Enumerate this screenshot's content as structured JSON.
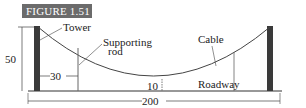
{
  "figure": {
    "label": "FIGURE 1.51"
  },
  "labels": {
    "tower": "Tower",
    "supporting_rod": "Supporting",
    "supporting_rod_line2": "rod",
    "cable": "Cable",
    "roadway": "Roadway"
  },
  "dimensions": {
    "height": "50",
    "rod_offset": "30",
    "min_clearance": "10",
    "span": "200"
  }
}
